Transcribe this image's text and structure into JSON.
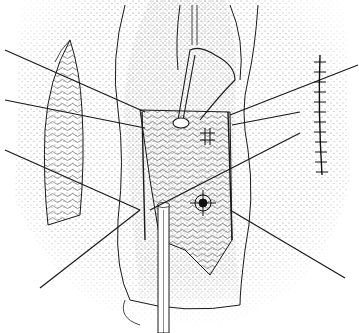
{
  "figure": {
    "style": "stippled line drawing",
    "colors": {
      "background": "#ffffff",
      "ink": "#1a1a1a",
      "stipple": "#333333"
    },
    "elements": {
      "retraction_sutures_count": 6,
      "instrument": "catheter/dilator inserted from below",
      "left_flap": "skin flap with fascial graft",
      "right_incision": "closed incision with interrupted sutures",
      "central_field": "exposed tissue with pursestring suture marks"
    }
  }
}
